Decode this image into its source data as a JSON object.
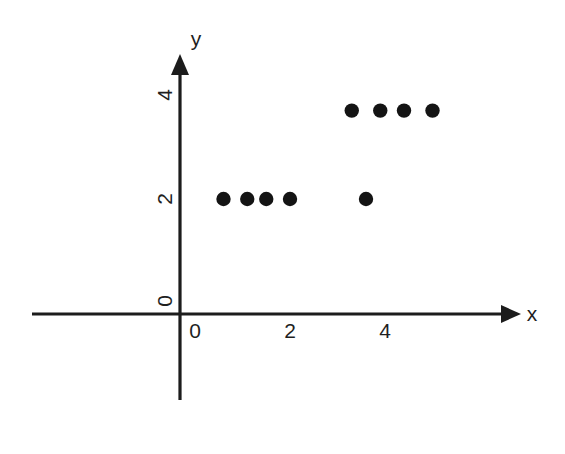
{
  "chart_data": {
    "type": "scatter",
    "title": "",
    "subtitle": "",
    "xlabel": "x",
    "ylabel": "y",
    "xlim": [
      -3.2,
      7.0
    ],
    "ylim": [
      -2.2,
      4.9
    ],
    "xticks": [
      0,
      2,
      4
    ],
    "yticks": [
      0,
      2,
      4
    ],
    "xtick_labels": [
      "0",
      "2",
      "4"
    ],
    "ytick_labels": [
      "0",
      "2",
      "4"
    ],
    "ytick_label_rotation_deg": 90,
    "grid": false,
    "legend": false,
    "axis_style": "arrow-terminated cartesian axes through origin",
    "series": [
      {
        "name": "data points",
        "marker": "filled-circle",
        "color": "#141414",
        "points": [
          {
            "x": 0.6,
            "y": 2.0
          },
          {
            "x": 1.1,
            "y": 2.0
          },
          {
            "x": 1.5,
            "y": 2.0
          },
          {
            "x": 2.0,
            "y": 2.0
          },
          {
            "x": 3.6,
            "y": 2.0
          },
          {
            "x": 3.3,
            "y": 3.7
          },
          {
            "x": 3.9,
            "y": 3.7
          },
          {
            "x": 4.4,
            "y": 3.7
          },
          {
            "x": 5.0,
            "y": 3.7
          }
        ]
      }
    ],
    "annotations": []
  },
  "axes": {
    "x_axis_label": "x",
    "y_axis_label": "y",
    "x_tick_0": "0",
    "x_tick_1": "2",
    "x_tick_2": "4",
    "y_tick_0": "0",
    "y_tick_1": "2",
    "y_tick_2": "4"
  },
  "colors": {
    "background": "#ffffff",
    "axis": "#1c1c1c",
    "marker": "#141414",
    "text": "#1f1f1f"
  }
}
